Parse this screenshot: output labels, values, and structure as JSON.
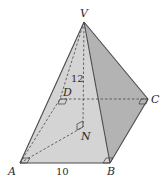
{
  "diagram": {
    "type": "square-based pyramid",
    "vertices": {
      "V": {
        "label": "V",
        "x": 84,
        "y": 22
      },
      "A": {
        "label": "A",
        "x": 20,
        "y": 163
      },
      "B": {
        "label": "B",
        "x": 110,
        "y": 163
      },
      "C": {
        "label": "C",
        "x": 148,
        "y": 99
      },
      "D": {
        "label": "D",
        "x": 60,
        "y": 99
      },
      "N": {
        "label": "N",
        "x": 83,
        "y": 127
      }
    },
    "measurements": {
      "height_label": "12",
      "base_edge_label": "10"
    },
    "colors": {
      "front_face": "#d4d4d4",
      "right_face": "#b3b3b3",
      "edge": "#4a4a4a",
      "hidden_edge": "#555555"
    }
  }
}
